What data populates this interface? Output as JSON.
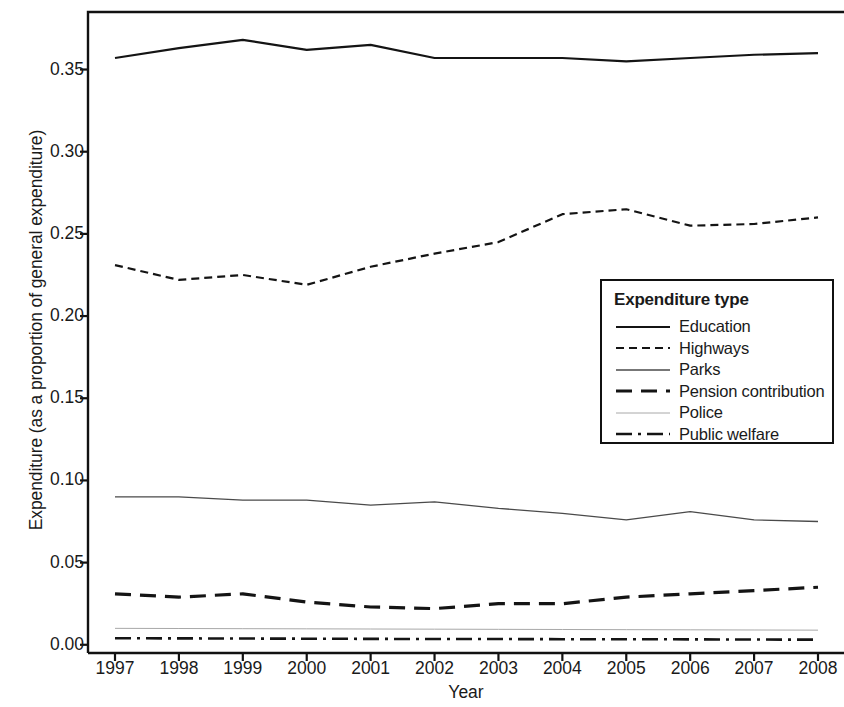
{
  "chart_data": {
    "type": "line",
    "title": "",
    "xlabel": "Year",
    "ylabel": "Expenditure (as a proportion of general expenditure)",
    "categories": [
      1997,
      1998,
      1999,
      2000,
      2001,
      2002,
      2003,
      2004,
      2005,
      2006,
      2007,
      2008
    ],
    "x": [
      "1997",
      "1998",
      "1999",
      "2000",
      "2001",
      "2002",
      "2003",
      "2004",
      "2005",
      "2006",
      "2007",
      "2008"
    ],
    "xlim": [
      1996.6,
      2008.4
    ],
    "ylim": [
      -0.005,
      0.385
    ],
    "yticks": [
      "0.00",
      "0.05",
      "0.10",
      "0.15",
      "0.20",
      "0.25",
      "0.30",
      "0.35"
    ],
    "ytick_values": [
      0.0,
      0.05,
      0.1,
      0.15,
      0.2,
      0.25,
      0.3,
      0.35
    ],
    "grid": false,
    "legend_position": "center-right",
    "legend_title": "Expenditure type",
    "series": [
      {
        "name": "Education",
        "style": "solid",
        "color": "#141414",
        "width": 2.2,
        "values": [
          0.357,
          0.363,
          0.368,
          0.362,
          0.365,
          0.357,
          0.357,
          0.357,
          0.355,
          0.357,
          0.359,
          0.36
        ]
      },
      {
        "name": "Highways",
        "style": "dashed",
        "color": "#141414",
        "width": 2.2,
        "values": [
          0.231,
          0.222,
          0.225,
          0.219,
          0.23,
          0.238,
          0.245,
          0.262,
          0.265,
          0.255,
          0.256,
          0.26
        ]
      },
      {
        "name": "Parks",
        "style": "solid-thin",
        "color": "#4a4a4a",
        "width": 1.3,
        "values": [
          0.09,
          0.09,
          0.088,
          0.088,
          0.085,
          0.087,
          0.083,
          0.08,
          0.076,
          0.081,
          0.076,
          0.075
        ]
      },
      {
        "name": "Pension contribution",
        "style": "long-dash",
        "color": "#141414",
        "width": 3.2,
        "values": [
          0.031,
          0.029,
          0.031,
          0.026,
          0.023,
          0.022,
          0.025,
          0.025,
          0.029,
          0.031,
          0.033,
          0.035
        ]
      },
      {
        "name": "Police",
        "style": "hairline",
        "color": "#a8a8a8",
        "width": 1.0,
        "values": [
          0.01,
          0.0099,
          0.0098,
          0.0097,
          0.0096,
          0.0095,
          0.0094,
          0.0093,
          0.0092,
          0.0091,
          0.009,
          0.0089
        ]
      },
      {
        "name": "Public welfare",
        "style": "dash-dot",
        "color": "#141414",
        "width": 2.6,
        "values": [
          0.004,
          0.0039,
          0.0038,
          0.0037,
          0.0036,
          0.0035,
          0.0035,
          0.0034,
          0.0034,
          0.0033,
          0.0032,
          0.0031
        ]
      }
    ]
  },
  "legend": {
    "title": "Expenditure type",
    "items": [
      {
        "label": "Education"
      },
      {
        "label": "Highways"
      },
      {
        "label": "Parks"
      },
      {
        "label": "Pension contribution"
      },
      {
        "label": "Police"
      },
      {
        "label": "Public welfare"
      }
    ]
  },
  "axes": {
    "x_title": "Year",
    "y_title": "Expenditure (as a proportion of general expenditure)",
    "y_tick_labels": [
      "0.35",
      "0.30",
      "0.25",
      "0.20",
      "0.15",
      "0.10",
      "0.05",
      "0.00"
    ],
    "x_tick_labels": [
      "1997",
      "1998",
      "1999",
      "2000",
      "2001",
      "2002",
      "2003",
      "2004",
      "2005",
      "2006",
      "2007",
      "2008"
    ]
  }
}
